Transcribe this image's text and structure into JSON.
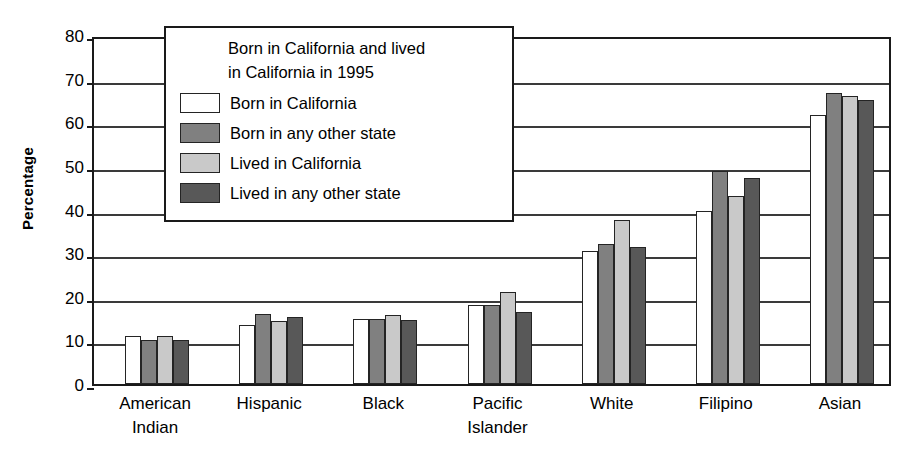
{
  "chart_data": {
    "type": "bar",
    "title": "",
    "xlabel": "",
    "ylabel": "Percentage",
    "ylim": [
      0,
      80
    ],
    "yticks": [
      0,
      10,
      20,
      30,
      40,
      50,
      60,
      70,
      80
    ],
    "ytick_labels": [
      "0",
      "10",
      "20",
      "30",
      "40",
      "50",
      "60",
      "70",
      "80"
    ],
    "grid": true,
    "legend_position": "upper-left-inside",
    "legend_title_lines": [
      "Born in California and lived",
      "in California in 1995"
    ],
    "categories": [
      "American Indian",
      "Hispanic",
      "Black",
      "Pacific Islander",
      "White",
      "Filipino",
      "Asian"
    ],
    "category_label_lines": [
      [
        "American",
        "Indian"
      ],
      [
        "Hispanic",
        ""
      ],
      [
        "Black",
        ""
      ],
      [
        "Pacific",
        "Islander"
      ],
      [
        "White",
        ""
      ],
      [
        "Filipino",
        ""
      ],
      [
        "Asian",
        ""
      ]
    ],
    "series": [
      {
        "name": "Born in California",
        "color": "#ffffff",
        "values": [
          11.0,
          13.5,
          14.8,
          18.0,
          30.6,
          39.6,
          61.6
        ]
      },
      {
        "name": "Born in any other state",
        "color": "#808080",
        "values": [
          10.1,
          16.0,
          14.8,
          18.0,
          32.0,
          48.8,
          66.8
        ]
      },
      {
        "name": "Lived in California",
        "color": "#c9c9c9",
        "values": [
          11.0,
          14.5,
          15.8,
          21.2,
          37.5,
          43.0,
          66.0
        ]
      },
      {
        "name": "Lived in any other state",
        "color": "#585858",
        "values": [
          10.0,
          15.4,
          14.6,
          16.5,
          31.3,
          47.3,
          65.2
        ]
      }
    ]
  },
  "colors": {
    "axis": "#1a1a1a",
    "grid": "#3a3a3a",
    "bar_outline": "#242424",
    "background": "#ffffff"
  }
}
